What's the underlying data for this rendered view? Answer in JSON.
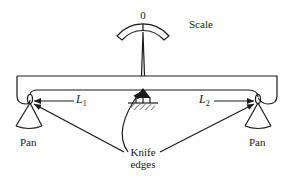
{
  "diagram": {
    "scale": {
      "zero_label": "0",
      "label": "Scale"
    },
    "arms": [
      {
        "symbol": "L",
        "subscript": "1"
      },
      {
        "symbol": "L",
        "subscript": "2"
      }
    ],
    "pans": [
      {
        "label": "Pan"
      },
      {
        "label": "Pan"
      }
    ],
    "knife_edges": {
      "line1": "Knife",
      "line2": "edges"
    },
    "colors": {
      "ink": "#1a1a1a",
      "background": "#ffffff"
    }
  }
}
